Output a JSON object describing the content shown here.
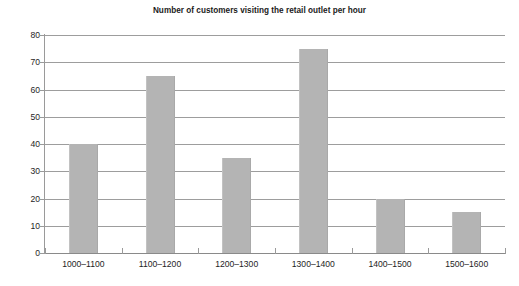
{
  "chart_data": {
    "type": "bar",
    "title": "Number of customers visiting the retail outlet per hour",
    "xlabel": "",
    "ylabel": "",
    "categories": [
      "1000–1100",
      "1100–1200",
      "1200–1300",
      "1300–1400",
      "1400–1500",
      "1500–1600"
    ],
    "values": [
      40,
      65,
      35,
      75,
      20,
      15
    ],
    "ylim": [
      0,
      80
    ],
    "ytick_step": 10,
    "yticks": [
      0,
      10,
      20,
      30,
      40,
      50,
      60,
      70,
      80
    ],
    "ytick_labels": [
      "0",
      "10",
      "20",
      "30",
      "40",
      "50",
      "60",
      "70",
      "80"
    ],
    "grid": true,
    "grid_axis": "y",
    "legend": false,
    "legend_position": "none",
    "bar_color": "#b4b4b4",
    "gridline_color": "#9d9d9d",
    "axis_color": "#8a8a8a",
    "text_color": "#1e1e1e",
    "background": "#ffffff"
  }
}
